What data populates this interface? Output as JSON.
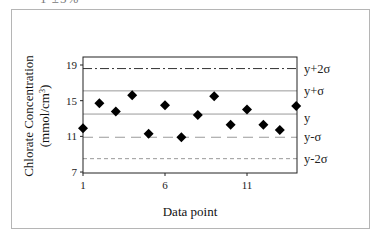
{
  "clipped_header_text": "1 ±5%",
  "chart_data": {
    "type": "scatter",
    "title": "",
    "xlabel": "Data point",
    "ylabel": "Chlorate Concentration (mmol/cm³)",
    "ylabel_line1": "Chlorate Concentration",
    "ylabel_line2": "(mmol/cm",
    "ylabel_sup": "3",
    "ylabel_close": ")",
    "xlim": [
      1,
      14
    ],
    "ylim": [
      7,
      20.5
    ],
    "x_ticks": [
      1,
      6,
      11
    ],
    "x_tick_labels": [
      "1",
      "6",
      "11"
    ],
    "y_ticks": [
      7,
      11,
      15,
      19
    ],
    "y_tick_labels": [
      "7",
      "11",
      "15",
      "19"
    ],
    "grid": false,
    "marker": "diamond",
    "marker_color": "#000000",
    "series": [
      {
        "name": "Chlorate concentration",
        "x": [
          1,
          2,
          3,
          4,
          5,
          6,
          7,
          8,
          9,
          10,
          11,
          12,
          13,
          14
        ],
        "values": [
          11.9,
          14.7,
          13.8,
          15.6,
          11.3,
          14.5,
          10.9,
          13.4,
          15.5,
          12.3,
          14.0,
          12.3,
          11.7,
          14.4
        ]
      }
    ],
    "reference_lines": [
      {
        "label": "y+2σ",
        "value": 18.6,
        "style": "dash-dot",
        "color": "#333333"
      },
      {
        "label": "y+σ",
        "value": 16.1,
        "style": "solid",
        "color": "#9a9a9a"
      },
      {
        "label": "y",
        "value": 13.5,
        "style": "solid",
        "color": "#9a9a9a"
      },
      {
        "label": "y-σ",
        "value": 10.9,
        "style": "long-dash",
        "color": "#9a9a9a"
      },
      {
        "label": "y-2σ",
        "value": 8.5,
        "style": "short-dash",
        "color": "#9a9a9a"
      }
    ]
  }
}
